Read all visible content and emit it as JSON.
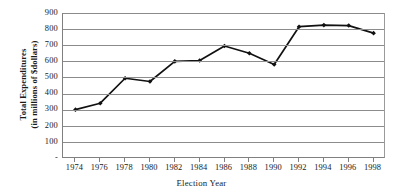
{
  "chart_data": {
    "type": "line",
    "title": "",
    "xlabel": "Election Year",
    "ylabel_line1": "Total Expenditures",
    "ylabel_line2": "(in millions of $dollars)",
    "categories": [
      "1974",
      "1976",
      "1978",
      "1980",
      "1982",
      "1984",
      "1986",
      "1988",
      "1990",
      "1992",
      "1994",
      "1996",
      "1998"
    ],
    "values": [
      300,
      340,
      495,
      475,
      600,
      605,
      695,
      650,
      580,
      815,
      825,
      822,
      775
    ],
    "series": [
      {
        "name": "Total Expenditures",
        "values": [
          300,
          340,
          495,
          475,
          600,
          605,
          695,
          650,
          580,
          815,
          825,
          822,
          775
        ]
      }
    ],
    "ylim": [
      0,
      900
    ],
    "ytick_values": [
      0,
      100,
      200,
      300,
      400,
      500,
      600,
      700,
      800,
      900
    ],
    "ytick_labels": [
      "-",
      "100",
      "200",
      "300",
      "400",
      "500",
      "600",
      "700",
      "800",
      "900"
    ],
    "grid": true,
    "legend": "none",
    "line_color": "#111111",
    "marker": "diamond",
    "grid_color": "#8c8c8c",
    "axis_color": "#808080"
  }
}
